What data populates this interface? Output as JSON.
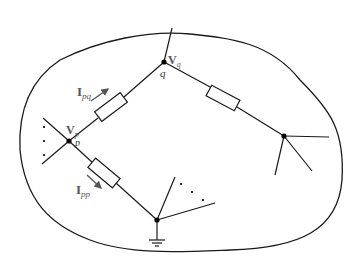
{
  "diagram": {
    "type": "power network region",
    "nodes": {
      "p": {
        "label": "p",
        "voltage_main": "V",
        "voltage_sub": "p"
      },
      "q": {
        "label": "q",
        "voltage_main": "V",
        "voltage_sub": "q"
      }
    },
    "currents": {
      "pq": {
        "main": "I",
        "sub": "pq"
      },
      "pp": {
        "main": "I",
        "sub": "pp"
      }
    },
    "ellipsis": "· · ·",
    "colors": {
      "line": "#1a1a1a",
      "label": "#555555",
      "arrow": "#555555"
    }
  }
}
